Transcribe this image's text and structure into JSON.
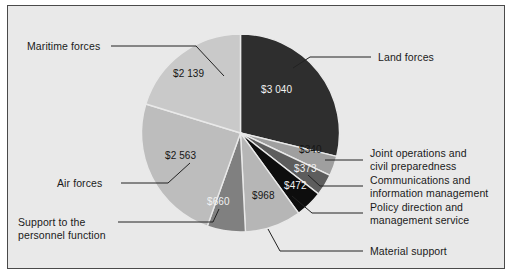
{
  "figure": {
    "background_color": "#e9e9e9",
    "border_color": "#4a4a4a",
    "currency_prefix": "$",
    "thousands_separator": " "
  },
  "chart_data": {
    "type": "pie",
    "title": "",
    "subtitle": "",
    "xlabel": "",
    "ylabel": "",
    "legend_position": "callout-labels",
    "grid": false,
    "total": 10555,
    "units": "$ millions",
    "categories": [
      "Land forces",
      "Joint operations and civil preparedness",
      "Communications and information management",
      "Policy direction and management service",
      "Material support",
      "Support to the personnel function",
      "Air forces",
      "Maritime forces"
    ],
    "values": [
      3040,
      340,
      373,
      472,
      968,
      660,
      2563,
      2139
    ],
    "value_labels": [
      "$3 040",
      "$340",
      "$373",
      "$472",
      "$968",
      "$660",
      "$2 563",
      "$2 139"
    ],
    "colors": [
      "#2e2e2e",
      "#9f9f9f",
      "#5d5d5d",
      "#0d0d0d",
      "#b6b6b6",
      "#808080",
      "#bdbdbd",
      "#c9c9c9"
    ],
    "slices": [
      {
        "name": "land-forces",
        "label": "Land forces",
        "value_label": "$3 040",
        "value": 3040,
        "color": "#2e2e2e",
        "text_tone": "dark"
      },
      {
        "name": "joint-operations",
        "label": "Joint operations and\ncivil preparedness",
        "value_label": "$340",
        "value": 340,
        "color": "#9f9f9f",
        "text_tone": "light"
      },
      {
        "name": "communications",
        "label": "Communications and\ninformation management",
        "value_label": "$373",
        "value": 373,
        "color": "#5d5d5d",
        "text_tone": "dark"
      },
      {
        "name": "policy-direction",
        "label": "Policy direction and\nmanagement service",
        "value_label": "$472",
        "value": 472,
        "color": "#0d0d0d",
        "text_tone": "dark"
      },
      {
        "name": "material-support",
        "label": "Material support",
        "value_label": "$968",
        "value": 968,
        "color": "#b6b6b6",
        "text_tone": "light"
      },
      {
        "name": "personnel-support",
        "label": "Support to the\npersonnel function",
        "value_label": "$660",
        "value": 660,
        "color": "#808080",
        "text_tone": "dark"
      },
      {
        "name": "air-forces",
        "label": "Air forces",
        "value_label": "$2 563",
        "value": 2563,
        "color": "#bdbdbd",
        "text_tone": "light"
      },
      {
        "name": "maritime-forces",
        "label": "Maritime forces",
        "value_label": "$2 139",
        "value": 2139,
        "color": "#c9c9c9",
        "text_tone": "light"
      }
    ]
  },
  "callouts": {
    "maritime_forces": "Maritime forces",
    "air_forces": "Air forces",
    "support_personnel": "Support to the\npersonnel function",
    "land_forces": "Land forces",
    "joint_operations": "Joint operations and\ncivil preparedness",
    "communications": "Communications and\ninformation management",
    "policy_direction": "Policy direction and\nmanagement service",
    "material_support": "Material support"
  },
  "values": {
    "land_forces": "$3 040",
    "maritime_forces": "$2 139",
    "air_forces": "$2 563",
    "support_personnel": "$660",
    "material_support": "$968",
    "policy_direction": "$472",
    "communications": "$373",
    "joint_operations": "$340"
  }
}
